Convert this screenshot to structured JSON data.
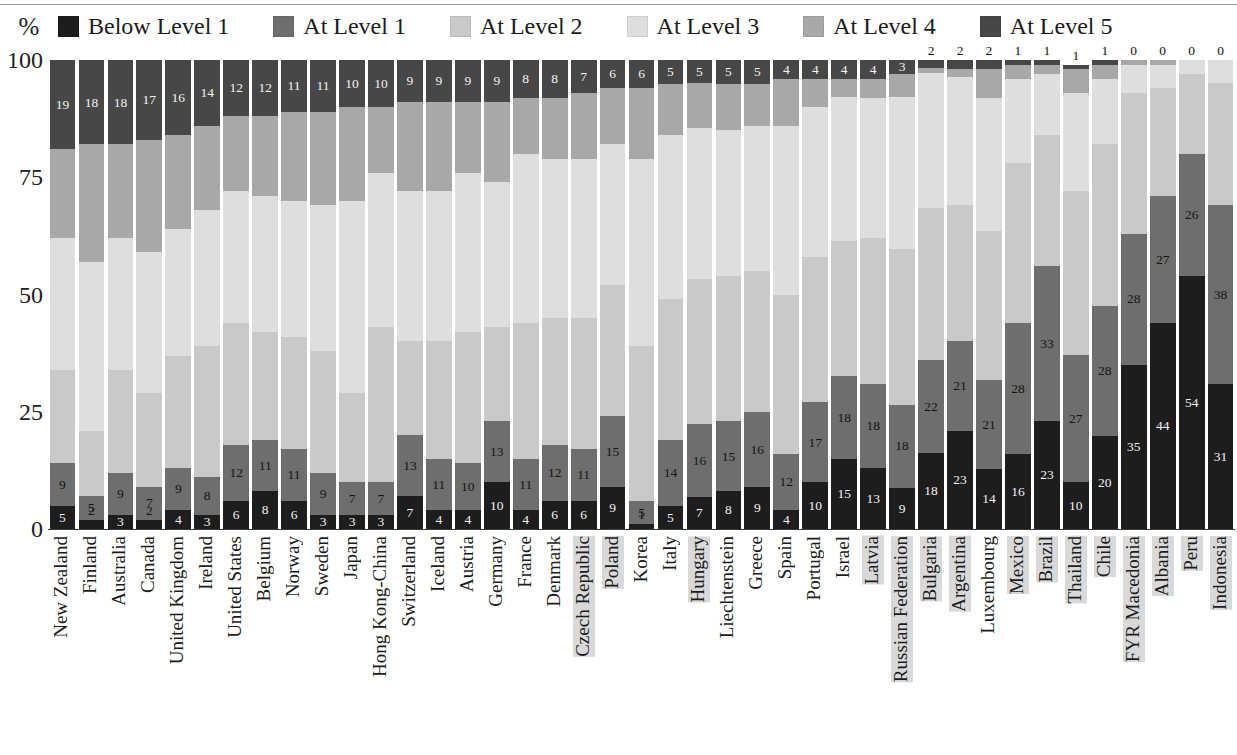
{
  "axis": {
    "unit_label": "%",
    "y_ticks": [
      "100",
      "75",
      "50",
      "25",
      "0"
    ]
  },
  "legend": {
    "items": [
      {
        "label": "Below Level 1",
        "color": "#1d1d1d"
      },
      {
        "label": "At Level 1",
        "color": "#6e6e6e"
      },
      {
        "label": "At Level 2",
        "color": "#c9c9c9"
      },
      {
        "label": "At Level 3",
        "color": "#dedede"
      },
      {
        "label": "At Level 4",
        "color": "#a8a8a8"
      },
      {
        "label": "At Level 5",
        "color": "#474747"
      }
    ]
  },
  "chart_data": {
    "type": "bar",
    "subtype": "stacked-100-percent",
    "title": "",
    "xlabel": "",
    "ylabel": "%",
    "ylim": [
      0,
      100
    ],
    "grid": false,
    "legend_position": "top",
    "series": [
      {
        "name": "Below Level 1",
        "color": "#1d1d1d",
        "values": [
          5,
          2,
          3,
          2,
          4,
          3,
          6,
          8,
          6,
          3,
          3,
          3,
          7,
          4,
          4,
          10,
          4,
          6,
          6,
          9,
          1,
          5,
          7,
          8,
          9,
          4,
          10,
          15,
          13,
          9,
          18,
          23,
          14,
          16,
          23,
          10,
          20,
          35,
          44,
          54,
          31
        ]
      },
      {
        "name": "At Level 1",
        "color": "#6e6e6e",
        "values": [
          9,
          5,
          9,
          7,
          9,
          8,
          12,
          11,
          11,
          9,
          7,
          7,
          13,
          11,
          10,
          13,
          11,
          12,
          11,
          15,
          5,
          14,
          16,
          15,
          16,
          12,
          17,
          18,
          18,
          18,
          22,
          21,
          21,
          28,
          33,
          27,
          28,
          28,
          27,
          26,
          38
        ]
      },
      {
        "name": "At Level 2",
        "color": "#c9c9c9",
        "values": [
          20,
          14,
          22,
          20,
          24,
          28,
          26,
          23,
          24,
          26,
          19,
          33,
          20,
          25,
          28,
          20,
          29,
          27,
          28,
          28,
          33,
          30,
          32,
          31,
          30,
          34,
          31,
          29,
          31,
          34,
          36,
          32,
          35,
          34,
          28,
          35,
          35,
          30,
          23,
          17,
          26
        ]
      },
      {
        "name": "At Level 3",
        "color": "#dedede",
        "values": [
          28,
          36,
          28,
          30,
          27,
          29,
          28,
          29,
          29,
          31,
          41,
          33,
          32,
          32,
          34,
          31,
          36,
          34,
          34,
          30,
          40,
          35,
          33,
          31,
          31,
          36,
          32,
          31,
          30,
          33,
          32,
          30,
          31,
          18,
          13,
          21,
          14,
          6,
          5,
          3,
          5
        ]
      },
      {
        "name": "At Level 4",
        "color": "#a8a8a8",
        "values": [
          19,
          25,
          20,
          24,
          20,
          18,
          16,
          17,
          19,
          20,
          20,
          14,
          19,
          19,
          15,
          17,
          12,
          13,
          14,
          12,
          15,
          11,
          10,
          10,
          9,
          10,
          6,
          4,
          4,
          5,
          1,
          2,
          7,
          3,
          2,
          5,
          3,
          1,
          1,
          0,
          0
        ]
      },
      {
        "name": "At Level 5",
        "color": "#474747",
        "values": [
          19,
          18,
          18,
          17,
          16,
          14,
          12,
          12,
          11,
          11,
          10,
          10,
          9,
          9,
          9,
          9,
          8,
          8,
          7,
          6,
          6,
          5,
          5,
          5,
          5,
          4,
          4,
          4,
          4,
          3,
          2,
          2,
          2,
          1,
          1,
          1,
          1,
          0,
          0,
          0,
          0
        ]
      }
    ],
    "categories": [
      "New Zealand",
      "Finland",
      "Australia",
      "Canada",
      "United Kingdom",
      "Ireland",
      "United States",
      "Belgium",
      "Norway",
      "Sweden",
      "Japan",
      "Hong Kong-China",
      "Switzerland",
      "Iceland",
      "Austria",
      "Germany",
      "France",
      "Denmark",
      "Czech Republic",
      "Poland",
      "Korea",
      "Italy",
      "Hungary",
      "Liechtenstein",
      "Greece",
      "Spain",
      "Portugal",
      "Israel",
      "Latvia",
      "Russian Federation",
      "Bulgaria",
      "Argentina",
      "Luxembourg",
      "Mexico",
      "Brazil",
      "Thailand",
      "Chile",
      "FYR Macedonia",
      "Albania",
      "Peru",
      "Indonesia"
    ],
    "highlighted_categories": [
      "Czech Republic",
      "Poland",
      "Hungary",
      "Latvia",
      "Russian Federation",
      "Bulgaria",
      "Argentina",
      "Mexico",
      "Brazil",
      "Thailand",
      "Chile",
      "FYR Macedonia",
      "Albania",
      "Peru",
      "Indonesia"
    ],
    "visible_labels": {
      "note": "Only Below Level 1, At Level 1 and At Level 5 values are printed inside/above the bars",
      "below_level_1": [
        5,
        2,
        3,
        2,
        4,
        3,
        6,
        8,
        6,
        3,
        3,
        3,
        7,
        4,
        4,
        10,
        4,
        6,
        6,
        9,
        1,
        5,
        7,
        8,
        9,
        4,
        10,
        15,
        13,
        9,
        18,
        23,
        14,
        16,
        23,
        10,
        20,
        35,
        44,
        54,
        31
      ],
      "at_level_1": [
        9,
        5,
        9,
        7,
        9,
        8,
        12,
        11,
        11,
        9,
        7,
        7,
        13,
        11,
        10,
        13,
        11,
        12,
        11,
        15,
        5,
        14,
        16,
        15,
        16,
        12,
        17,
        18,
        18,
        18,
        22,
        21,
        21,
        28,
        33,
        27,
        28,
        28,
        27,
        26,
        38
      ],
      "at_level_5": [
        19,
        18,
        18,
        17,
        16,
        14,
        12,
        12,
        11,
        11,
        10,
        10,
        9,
        9,
        9,
        9,
        8,
        8,
        7,
        6,
        6,
        5,
        5,
        5,
        5,
        4,
        4,
        4,
        4,
        3,
        2,
        2,
        2,
        1,
        1,
        1,
        1,
        0,
        0,
        0,
        0
      ]
    }
  }
}
